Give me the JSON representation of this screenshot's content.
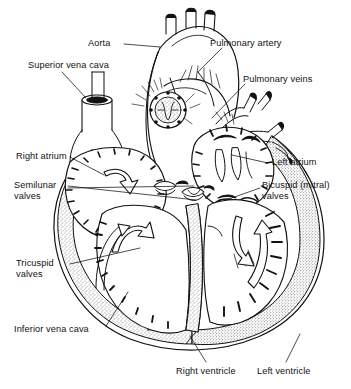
{
  "figure": {
    "style": "black-and-white line drawing with stippled muscle wall",
    "width": 351,
    "height": 389,
    "background_color": "#ffffff",
    "ink_color": "#111111"
  },
  "labels": [
    {
      "id": "aorta",
      "text": "Aorta",
      "x": 88,
      "y": 38,
      "align": "left"
    },
    {
      "id": "pulmonary-artery",
      "text": "Pulmonary artery",
      "x": 210,
      "y": 38,
      "align": "left"
    },
    {
      "id": "superior-vena-cava",
      "text": "Superior vena cava",
      "x": 28,
      "y": 60,
      "align": "left"
    },
    {
      "id": "pulmonary-veins",
      "text": "Pulmonary veins",
      "x": 243,
      "y": 74,
      "align": "left"
    },
    {
      "id": "right-atrium",
      "text": "Right atrium",
      "x": 16,
      "y": 151,
      "align": "left"
    },
    {
      "id": "left-atrium",
      "text": "Left atrium",
      "x": 272,
      "y": 157,
      "align": "left"
    },
    {
      "id": "semilunar-valves",
      "text": "Semilunar\nvalves",
      "x": 14,
      "y": 180,
      "align": "left"
    },
    {
      "id": "bicuspid-valves",
      "text": "Bicuspid (mitral)\nvalves",
      "x": 262,
      "y": 180,
      "align": "left"
    },
    {
      "id": "tricuspid-valves",
      "text": "Tricuspid\nvalves",
      "x": 16,
      "y": 258,
      "align": "left"
    },
    {
      "id": "inferior-vena-cava",
      "text": "Inferior vena cava",
      "x": 14,
      "y": 324,
      "align": "left"
    },
    {
      "id": "right-ventricle",
      "text": "Right ventricle",
      "x": 176,
      "y": 366,
      "align": "left"
    },
    {
      "id": "left-ventricle",
      "text": "Left ventricle",
      "x": 257,
      "y": 366,
      "align": "left"
    }
  ],
  "leader_lines": [
    {
      "id": "aorta-leader",
      "from": [
        124,
        44
      ],
      "to": [
        160,
        47
      ]
    },
    {
      "id": "pulmonary-artery-leader",
      "from": [
        222,
        48
      ],
      "to": [
        198,
        72
      ]
    },
    {
      "id": "superior-vena-cava-leader",
      "from": [
        62,
        72
      ],
      "to": [
        86,
        98
      ]
    },
    {
      "id": "pulmonary-veins-leader",
      "from": [
        245,
        84
      ],
      "to": [
        212,
        118
      ]
    },
    {
      "id": "right-atrium-leader",
      "from": [
        70,
        157
      ],
      "to": [
        104,
        175
      ]
    },
    {
      "id": "left-atrium-leader",
      "from": [
        268,
        163
      ],
      "to": [
        232,
        155
      ]
    },
    {
      "id": "semilunar-valves-leader-1",
      "from": [
        68,
        186
      ],
      "to": [
        196,
        200
      ]
    },
    {
      "id": "semilunar-valves-leader-2",
      "from": [
        68,
        188
      ],
      "to": [
        194,
        186
      ]
    },
    {
      "id": "bicuspid-valves-leader",
      "from": [
        260,
        188
      ],
      "to": [
        226,
        200
      ]
    },
    {
      "id": "tricuspid-valves-leader",
      "from": [
        70,
        264
      ],
      "to": [
        140,
        248
      ]
    },
    {
      "id": "inferior-vena-cava-leader",
      "from": [
        106,
        326
      ],
      "to": [
        128,
        292
      ]
    },
    {
      "id": "right-ventricle-leader",
      "from": [
        206,
        362
      ],
      "to": [
        190,
        336
      ]
    },
    {
      "id": "left-ventricle-leader",
      "from": [
        286,
        362
      ],
      "to": [
        300,
        334
      ]
    }
  ],
  "anatomy_parts": [
    "aortic-arch",
    "brachiocephalic-branches",
    "pulmonary-trunk",
    "pulmonary-veins-branches",
    "superior-vena-cava-tube",
    "inferior-vena-cava-tube",
    "right-atrium-chamber",
    "left-atrium-chamber",
    "right-ventricle-chamber",
    "left-ventricle-chamber",
    "interventricular-septum",
    "semilunar-valve-cusps",
    "tricuspid-valve-cusps",
    "bicuspid-valve-cusps",
    "papillary-muscles",
    "chordae-tendineae",
    "myocardium-wall",
    "coronary-vessels",
    "blood-flow-arrows"
  ]
}
